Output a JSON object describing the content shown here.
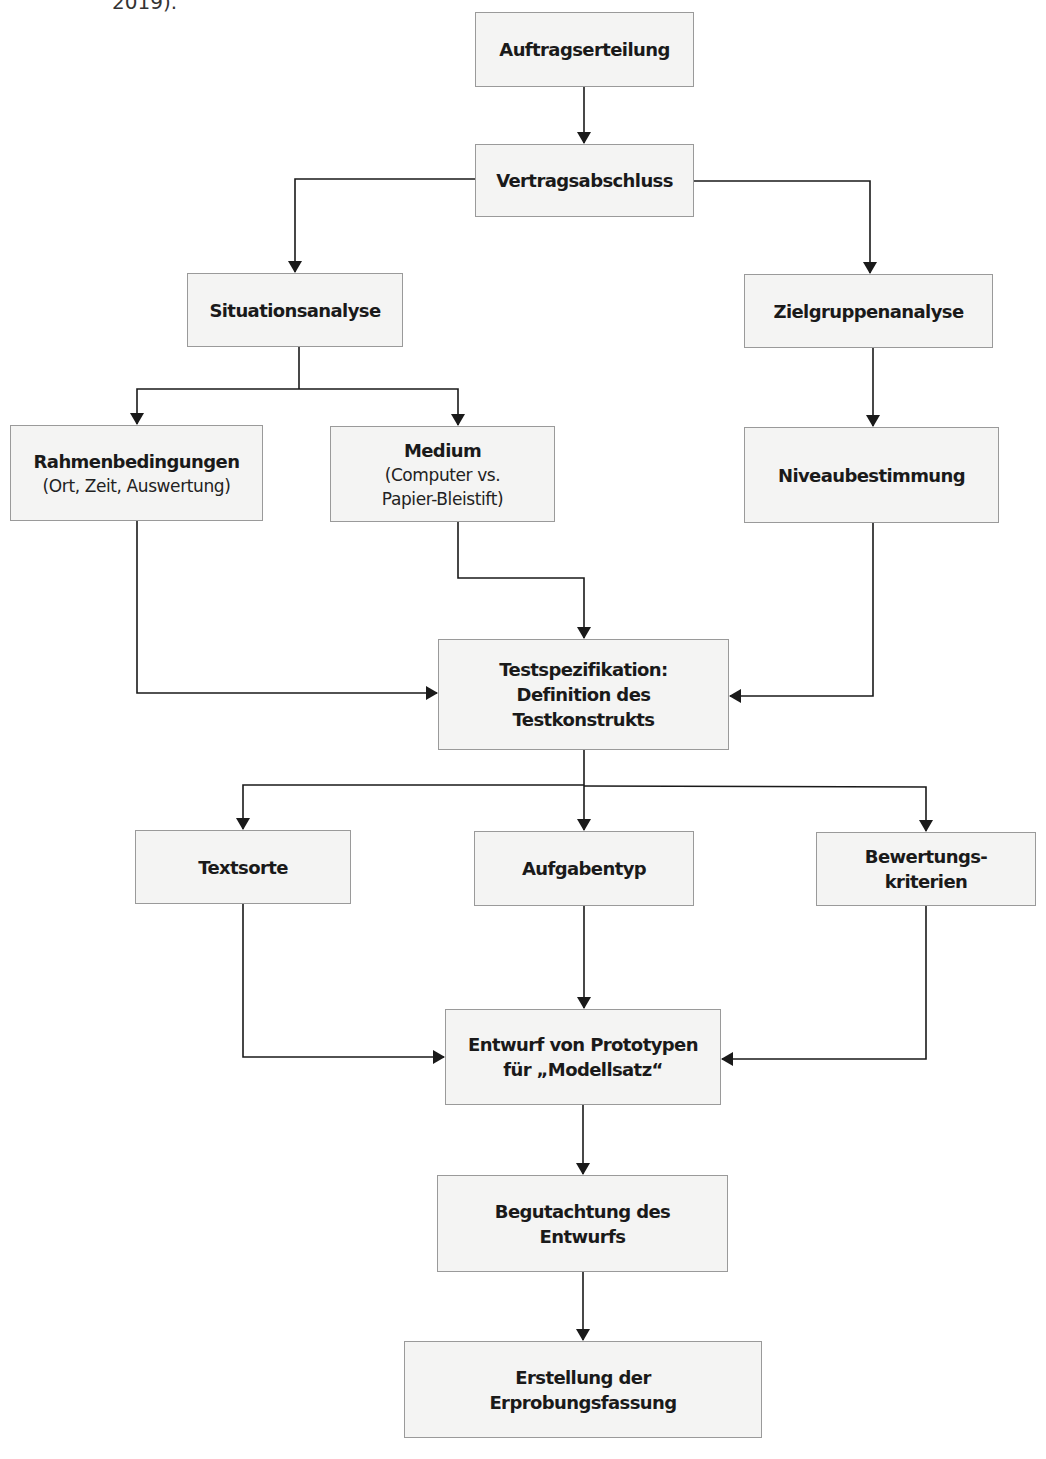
{
  "caption_fragment": "2019).",
  "colors": {
    "box_fill": "#f4f4f3",
    "box_border": "#9a9a9a",
    "line": "#1a1a1a",
    "text": "#1a1a1a"
  },
  "nodes": {
    "auftragserteilung": {
      "title": "Auftragserteilung"
    },
    "vertragsabschluss": {
      "title": "Vertragsabschluss"
    },
    "situationsanalyse": {
      "title": "Situationsanalyse"
    },
    "zielgruppenanalyse": {
      "title": "Zielgruppenanalyse"
    },
    "rahmenbedingungen": {
      "title": "Rahmenbedingungen",
      "sub": "(Ort, Zeit, Auswertung)"
    },
    "medium": {
      "title": "Medium",
      "sub": "(Computer vs.\nPapier-Bleistift)"
    },
    "niveaubestimmung": {
      "title": "Niveaubestimmung"
    },
    "testspezifikation": {
      "title": "Testspezifikation:\nDefinition des\nTestkonstrukts"
    },
    "textsorte": {
      "title": "Textsorte"
    },
    "aufgabentyp": {
      "title": "Aufgabentyp"
    },
    "bewertungskriterien": {
      "title": "Bewertungs-\nkriterien"
    },
    "entwurf": {
      "title": "Entwurf von Prototypen\nfür „Modellsatz“"
    },
    "begutachtung": {
      "title": "Begutachtung des\nEntwurfs"
    },
    "erstellung": {
      "title": "Erstellung der\nErprobungsfassung"
    }
  },
  "edges": [
    {
      "from": "Auftragserteilung",
      "to": "Vertragsabschluss"
    },
    {
      "from": "Vertragsabschluss",
      "to": "Situationsanalyse"
    },
    {
      "from": "Vertragsabschluss",
      "to": "Zielgruppenanalyse"
    },
    {
      "from": "Situationsanalyse",
      "to": "Rahmenbedingungen"
    },
    {
      "from": "Situationsanalyse",
      "to": "Medium"
    },
    {
      "from": "Zielgruppenanalyse",
      "to": "Niveaubestimmung"
    },
    {
      "from": "Rahmenbedingungen",
      "to": "Testspezifikation"
    },
    {
      "from": "Medium",
      "to": "Testspezifikation"
    },
    {
      "from": "Niveaubestimmung",
      "to": "Testspezifikation"
    },
    {
      "from": "Testspezifikation",
      "to": "Textsorte"
    },
    {
      "from": "Testspezifikation",
      "to": "Aufgabentyp"
    },
    {
      "from": "Testspezifikation",
      "to": "Bewertungskriterien"
    },
    {
      "from": "Textsorte",
      "to": "Entwurf von Prototypen"
    },
    {
      "from": "Aufgabentyp",
      "to": "Entwurf von Prototypen"
    },
    {
      "from": "Bewertungskriterien",
      "to": "Entwurf von Prototypen"
    },
    {
      "from": "Entwurf von Prototypen",
      "to": "Begutachtung des Entwurfs"
    },
    {
      "from": "Begutachtung des Entwurfs",
      "to": "Erstellung der Erprobungsfassung"
    }
  ]
}
